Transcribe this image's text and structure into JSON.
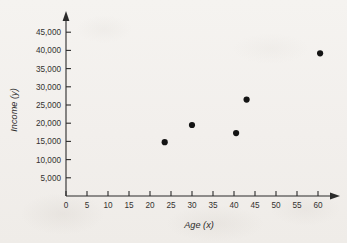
{
  "figure": {
    "background_color": "#f3f1ee",
    "ink_color": "#2b2b2b"
  },
  "chart_data": {
    "type": "scatter",
    "title": "",
    "xlabel": "Age (x)",
    "ylabel": "Income (y)",
    "xlim": [
      0,
      65
    ],
    "ylim": [
      0,
      47500
    ],
    "grid": false,
    "legend": "none",
    "x_ticks": [
      0,
      5,
      10,
      15,
      20,
      25,
      30,
      35,
      40,
      45,
      50,
      55,
      60
    ],
    "x_tick_labels": [
      "0",
      "5",
      "10",
      "15",
      "20",
      "25",
      "30",
      "35",
      "40",
      "45",
      "50",
      "55",
      "60"
    ],
    "y_ticks": [
      5000,
      10000,
      15000,
      20000,
      25000,
      30000,
      35000,
      40000,
      45000
    ],
    "y_tick_labels": [
      "5,000",
      "10,000",
      "15,000",
      "20,000",
      "25,000",
      "30,000",
      "35,000",
      "40,000",
      "45,000"
    ],
    "points": [
      {
        "x": 23.5,
        "y": 14800
      },
      {
        "x": 30.0,
        "y": 19500
      },
      {
        "x": 40.5,
        "y": 17300
      },
      {
        "x": 43.0,
        "y": 26500
      },
      {
        "x": 60.5,
        "y": 39200
      }
    ],
    "marker": {
      "shape": "circle",
      "size": 3.1,
      "color": "#141414"
    }
  }
}
